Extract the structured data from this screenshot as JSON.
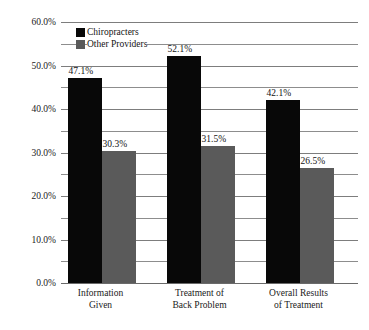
{
  "chart_data": {
    "type": "bar",
    "title": "",
    "subtitle": "",
    "xlabel": "",
    "ylabel": "",
    "ylim": [
      0,
      60
    ],
    "ytick_step": 10,
    "gridline_step": 5,
    "grid": true,
    "legend_position": "top-left-inside",
    "value_suffix": "%",
    "categories": [
      "Information\nGiven",
      "Treatment of\nBack Problem",
      "Overall Results\nof Treatment"
    ],
    "yticks": [
      "0.0%",
      "10.0%",
      "20.0%",
      "30.0%",
      "40.0%",
      "50.0%",
      "60.0%"
    ],
    "ytick_values": [
      0,
      10,
      20,
      30,
      40,
      50,
      60
    ],
    "series": [
      {
        "name": "Chiropracters",
        "color": "#080808",
        "values": [
          47.1,
          52.1,
          42.1
        ],
        "labels": [
          "47.1%",
          "52.1%",
          "42.1%"
        ]
      },
      {
        "name": "Other Providers",
        "color": "#5a5a5a",
        "values": [
          30.3,
          31.5,
          26.5
        ],
        "labels": [
          "30.3%",
          "31.5%",
          "26.5%"
        ]
      }
    ]
  },
  "colors": {
    "background": "#ffffff",
    "gridline": "#8d8d8d",
    "axis": "#6a6a6a",
    "text": "#1a1a1a",
    "series_0": "#080808",
    "series_1": "#5a5a5a"
  }
}
